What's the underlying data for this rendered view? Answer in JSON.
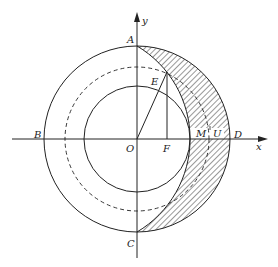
{
  "diagram": {
    "title": "",
    "axes": {
      "x_label": "x",
      "y_label": "y"
    },
    "points": {
      "A": "A",
      "B": "B",
      "C": "C",
      "D": "D",
      "E": "E",
      "F": "F",
      "M": "M",
      "U": "U",
      "O": "O"
    },
    "circles": [
      {
        "name": "outer-circle",
        "style": "solid"
      },
      {
        "name": "middle-circle",
        "style": "dashed"
      },
      {
        "name": "inner-circle",
        "style": "solid"
      }
    ],
    "shaded_region": "crescent between arc A-M-C and outer arc A-D-C",
    "colors": {
      "stroke": "#222222",
      "background": "#ffffff"
    }
  }
}
